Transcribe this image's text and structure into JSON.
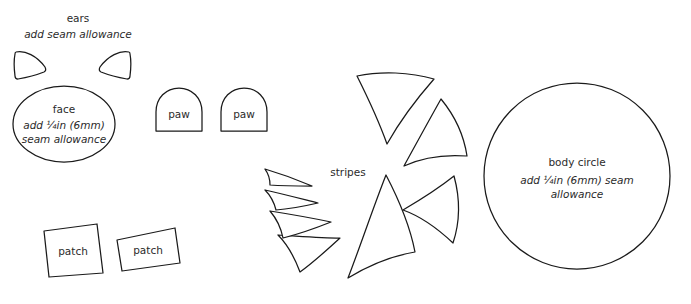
{
  "sheet": {
    "title": "Sewing Pattern Template",
    "background_color": "#ffffff",
    "stroke_color": "#1a1a1a",
    "text_color": "#2b2b2b",
    "width": 691,
    "height": 304
  },
  "ears": {
    "heading": "ears",
    "note": "add seam allowance",
    "count": 2
  },
  "face": {
    "label": "face",
    "note_line1": "add ¼in (6mm)",
    "note_line2": "seam allowance"
  },
  "paws": {
    "left_label": "paw",
    "right_label": "paw",
    "count": 2
  },
  "stripes": {
    "label": "stripes",
    "count": 8
  },
  "body": {
    "label": "body circle",
    "note_line1": "add ¼in (6mm) seam",
    "note_line2": "allowance"
  },
  "patches": {
    "left_label": "patch",
    "right_label": "patch",
    "count": 2
  }
}
